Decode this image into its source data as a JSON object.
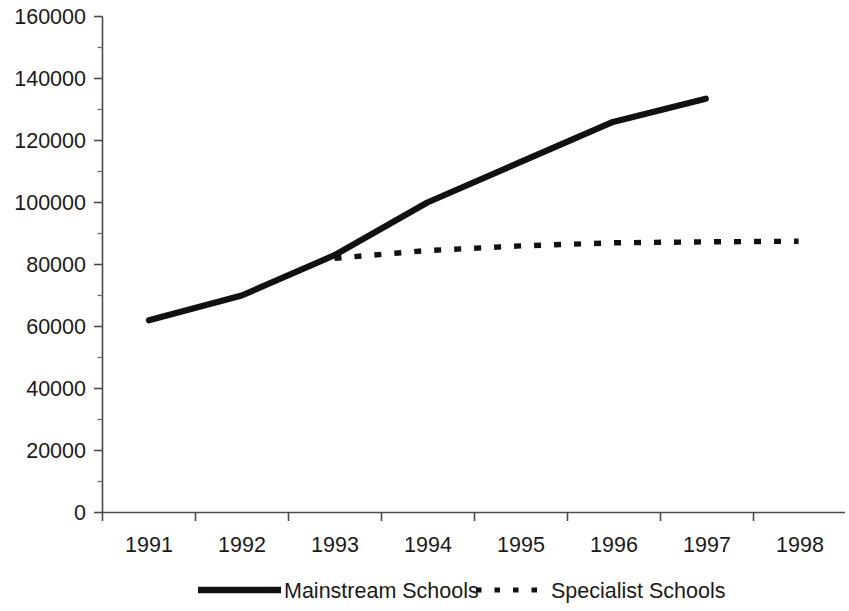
{
  "chart_data": {
    "type": "line",
    "title": "",
    "subtitle": "",
    "xlabel": "",
    "ylabel": "",
    "x": [
      1991,
      1992,
      1993,
      1994,
      1995,
      1996,
      1997,
      1998
    ],
    "xtick_labels": [
      "1991",
      "1992",
      "1993",
      "1994",
      "1995",
      "1996",
      "1997",
      "1998"
    ],
    "ytick_labels": [
      "0",
      "20000",
      "40000",
      "60000",
      "80000",
      "100000",
      "120000",
      "140000",
      "160000"
    ],
    "ytick_values": [
      0,
      20000,
      40000,
      60000,
      80000,
      100000,
      120000,
      140000,
      160000
    ],
    "yminor_values": [
      10000,
      30000,
      50000,
      70000,
      90000,
      110000,
      130000,
      150000
    ],
    "ylim": [
      0,
      160000
    ],
    "grid": false,
    "legend_position": "bottom",
    "series": [
      {
        "name": "Mainstream Schools",
        "style": "solid",
        "color": "#111111",
        "x": [
          1991,
          1992,
          1993,
          1994,
          1995,
          1996,
          1997
        ],
        "values": [
          62000,
          70000,
          83000,
          100000,
          113000,
          126000,
          133500
        ]
      },
      {
        "name": "Specialist Schools",
        "style": "dotted",
        "color": "#111111",
        "x": [
          1993,
          1994,
          1995,
          1996,
          1997,
          1998
        ],
        "values": [
          82000,
          84500,
          86000,
          87000,
          87300,
          87500
        ]
      }
    ]
  },
  "legend": {
    "items": [
      {
        "label": "Mainstream Schools",
        "style": "solid"
      },
      {
        "label": "Specialist Schools",
        "style": "dotted"
      }
    ]
  },
  "axes": {
    "y_tick_0": "0",
    "y_tick_1": "20000",
    "y_tick_2": "40000",
    "y_tick_3": "60000",
    "y_tick_4": "80000",
    "y_tick_5": "100000",
    "y_tick_6": "120000",
    "y_tick_7": "140000",
    "y_tick_8": "160000",
    "x_tick_0": "1991",
    "x_tick_1": "1992",
    "x_tick_2": "1993",
    "x_tick_3": "1994",
    "x_tick_4": "1995",
    "x_tick_5": "1996",
    "x_tick_6": "1997",
    "x_tick_7": "1998"
  }
}
